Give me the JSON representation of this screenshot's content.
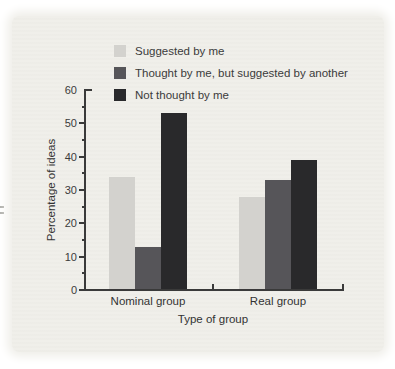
{
  "chart_data": {
    "type": "bar",
    "categories": [
      "Nominal group",
      "Real group"
    ],
    "series": [
      {
        "name": "Suggested by me",
        "color": "#d3d2ce",
        "values": [
          34,
          28
        ]
      },
      {
        "name": "Thought by me, but suggested by another",
        "color": "#565559",
        "values": [
          13,
          33
        ]
      },
      {
        "name": "Not thought by me",
        "color": "#29292b",
        "values": [
          53,
          39
        ]
      }
    ],
    "title": "",
    "xlabel": "Type of group",
    "ylabel": "Percentage of ideas",
    "ylim": [
      0,
      60
    ],
    "ytick_major": 10,
    "ytick_minor": 5,
    "grid": false,
    "legend_position": "top"
  },
  "colors": {
    "page_background": "#ffffff",
    "panel_background": "#f0efea",
    "axis": "#3a3a3a",
    "text": "#3b3b3b"
  }
}
